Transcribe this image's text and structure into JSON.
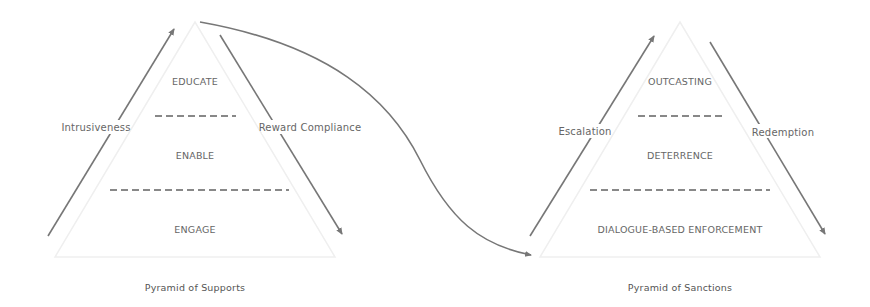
{
  "diagram": {
    "colors": {
      "arrow": "#777777",
      "outline": "#eeeeee",
      "dash": "#888888",
      "text": "#666666"
    },
    "left_pyramid": {
      "caption": "Pyramid of Supports",
      "layers": [
        "EDUCATE",
        "ENABLE",
        "ENGAGE"
      ],
      "left_arrow_label": "Intrusiveness",
      "right_arrow_label": "Reward Compliance"
    },
    "right_pyramid": {
      "caption": "Pyramid of Sanctions",
      "layers": [
        "OUTCASTING",
        "DETERRENCE",
        "DIALOGUE-BASED ENFORCEMENT"
      ],
      "left_arrow_label": "Escalation",
      "right_arrow_label": "Redemption"
    }
  }
}
